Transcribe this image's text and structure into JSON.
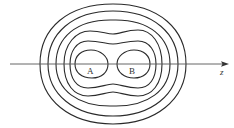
{
  "diagram": {
    "type": "contour-lines",
    "axis": {
      "label": "z",
      "direction": "right"
    },
    "points": [
      {
        "label": "A"
      },
      {
        "label": "B"
      }
    ],
    "contour_count": 6,
    "colors": {
      "stroke": "#2a2a2a",
      "background": "#ffffff"
    }
  }
}
